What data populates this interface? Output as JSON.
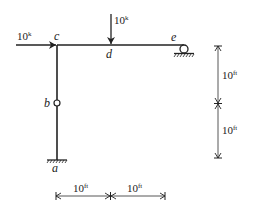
{
  "diagram": {
    "type": "structural frame",
    "loads": {
      "horizontal": {
        "value": "10",
        "unit": "k",
        "at": "c"
      },
      "vertical": {
        "value": "10",
        "unit": "k",
        "at": "d"
      }
    },
    "nodes": {
      "a": "a",
      "b": "b",
      "c": "c",
      "d": "d",
      "e": "e"
    },
    "dimensions": {
      "vertical_upper": {
        "value": "10",
        "unit": "ft"
      },
      "vertical_lower": {
        "value": "10",
        "unit": "ft"
      },
      "horizontal_left": {
        "value": "10",
        "unit": "ft"
      },
      "horizontal_right": {
        "value": "10",
        "unit": "ft"
      }
    },
    "supports": {
      "a": "fixed",
      "e": "roller"
    },
    "hinge": "b"
  }
}
